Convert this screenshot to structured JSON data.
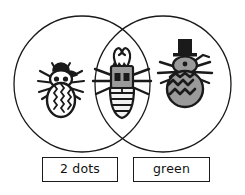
{
  "diagram": {
    "type": "venn",
    "title": "",
    "background_color": "#ffffff",
    "stroke_color": "#1a1a1a",
    "fill_gray": "#9a9a9a",
    "sets": [
      {
        "id": "left",
        "label": "2 dots",
        "center_x": 82,
        "center_y": 84,
        "radius": 68
      },
      {
        "id": "right",
        "label": "green",
        "center_x": 163,
        "center_y": 84,
        "radius": 68
      }
    ],
    "regions": [
      {
        "id": "left-only",
        "belongs_to": [
          "2 dots"
        ],
        "item": {
          "name": "bug-two-dots-white",
          "description": "bug with cap, two dots on white head, white body with vertical zigzag stripes",
          "dots": 2,
          "green": false,
          "head_fill": "#ffffff",
          "body_fill": "#ffffff"
        }
      },
      {
        "id": "intersection",
        "belongs_to": [
          "2 dots",
          "green"
        ],
        "item": {
          "name": "bug-two-dots-green",
          "description": "bug with curly antennae, two dots on green thorax, striped abdomen",
          "dots": 2,
          "green": true,
          "head_fill": "#9a9a9a",
          "body_fill": "#9a9a9a"
        }
      },
      {
        "id": "right-only",
        "belongs_to": [
          "green"
        ],
        "item": {
          "name": "bug-green-top-hat",
          "description": "bug with black top hat, green head, green body with black zigzag chevrons, no dots",
          "dots": 0,
          "green": true,
          "head_fill": "#9a9a9a",
          "body_fill": "#9a9a9a"
        }
      }
    ]
  },
  "labels": {
    "left": "2 dots",
    "right": "green"
  }
}
